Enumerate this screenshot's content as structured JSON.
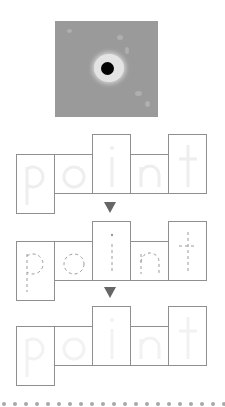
{
  "photo": {
    "description": "gray textured photo with a black dot at center surrounded by a light halo"
  },
  "word": "point",
  "letters": [
    "p",
    "o",
    "i",
    "n",
    "t"
  ],
  "rows": [
    {
      "style": "solid-faint",
      "letters": [
        "p",
        "o",
        "i",
        "n",
        "t"
      ]
    },
    {
      "style": "dashed-trace",
      "letters": [
        "p",
        "o",
        "i",
        "n",
        "t"
      ]
    },
    {
      "style": "blank-faint",
      "letters": [
        "p",
        "o",
        "i",
        "n",
        "t"
      ]
    }
  ],
  "arrows": [
    "down-arrow-icon",
    "down-arrow-icon"
  ],
  "colors": {
    "box_border": "#8f8f8f",
    "arrow": "#666666",
    "faint_letter": "#eeeeee",
    "dashed_letter": "#9a9a9a",
    "photo_bg": "#9a9a9a"
  }
}
